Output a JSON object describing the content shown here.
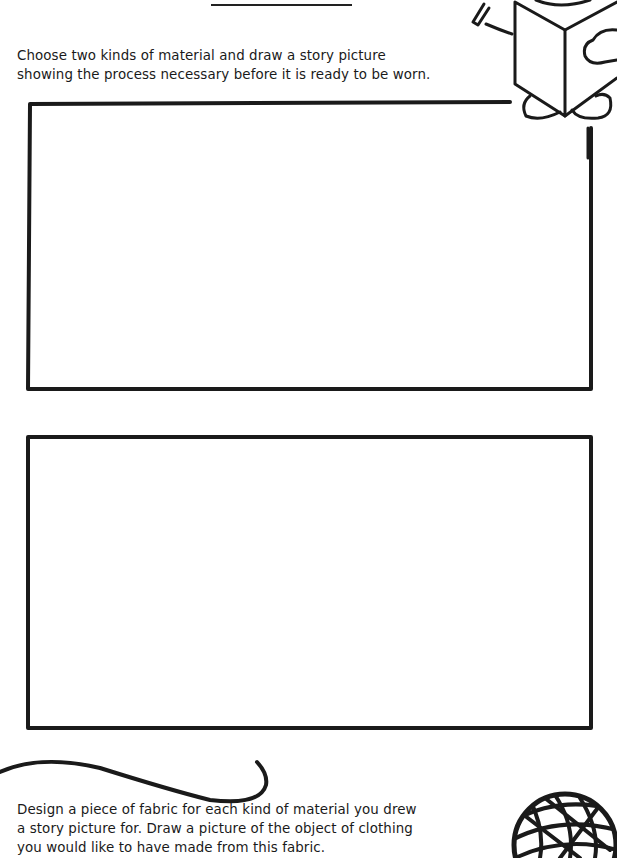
{
  "worksheet": {
    "top_instructions": {
      "lines": [
        "Choose two kinds of material and draw a story picture",
        "showing the process necessary before it is ready to be worn."
      ]
    },
    "drawing_boxes": [
      {
        "label": "story-picture-box-1"
      },
      {
        "label": "story-picture-box-2"
      }
    ],
    "bottom_instructions": {
      "lines": [
        "Design a piece of fabric for each kind of material you drew",
        "a story picture for.  Draw a picture of the object of clothing",
        "you would like to have made from this fabric."
      ]
    },
    "illustrations": {
      "top_right": "owl-reading-book-icon",
      "bottom_left": "yarn-thread-icon",
      "bottom_right": "yarn-ball-icon"
    },
    "colors": {
      "ink": "#1a1a1a",
      "paper": "#ffffff"
    }
  }
}
